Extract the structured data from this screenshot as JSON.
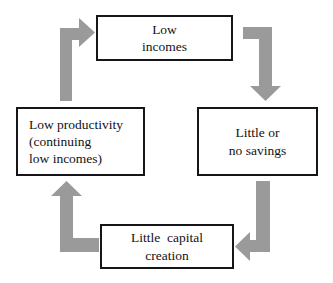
{
  "diagram": {
    "background_color": "#ffffff",
    "box_border_color": "#16161a",
    "box_fill_color": "#ffffff",
    "text_color": "#121214",
    "arrow_color": "#9a9a9a",
    "nodes": [
      {
        "id": "low-incomes",
        "text": "Low\nincomes",
        "line1": "Low",
        "line2": "incomes",
        "align": "center",
        "position": "top"
      },
      {
        "id": "no-savings",
        "text": "Little or\nno savings",
        "line1": "Little or",
        "line2": "no savings",
        "align": "center",
        "position": "right"
      },
      {
        "id": "capital-creation",
        "text": "Little  capital\ncreation",
        "line1": "Little  capital",
        "line2": "creation",
        "align": "center",
        "position": "bottom"
      },
      {
        "id": "low-productivity",
        "text": "Low productivity\n(continuing\nlow incomes)",
        "line1": "Low productivity",
        "line2": "(continuing",
        "line3": "low incomes)",
        "align": "left",
        "position": "left"
      }
    ],
    "arrows": [
      {
        "id": "low-incomes-to-no-savings",
        "from": "low-incomes",
        "to": "no-savings",
        "shape": "elbow-right-then-down",
        "head_direction": "down"
      },
      {
        "id": "no-savings-to-capital-creation",
        "from": "no-savings",
        "to": "capital-creation",
        "shape": "elbow-down-then-left",
        "head_direction": "left"
      },
      {
        "id": "capital-creation-to-low-productivity",
        "from": "capital-creation",
        "to": "low-productivity",
        "shape": "elbow-left-then-up",
        "head_direction": "up"
      },
      {
        "id": "low-productivity-to-low-incomes",
        "from": "low-productivity",
        "to": "low-incomes",
        "shape": "elbow-up-then-right",
        "head_direction": "right"
      }
    ]
  }
}
